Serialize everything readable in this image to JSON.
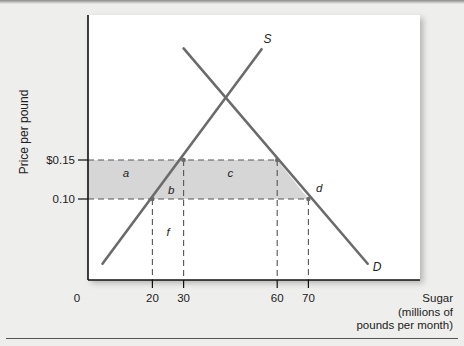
{
  "chart_data": {
    "type": "line",
    "title": "",
    "ylabel": "Price per pound",
    "xlabel": [
      "Sugar",
      "(millions of",
      "pounds per month)"
    ],
    "origin_label": "0",
    "x_ticks": [
      {
        "value": 20,
        "label": "20"
      },
      {
        "value": 30,
        "label": "30"
      },
      {
        "value": 60,
        "label": "60"
      },
      {
        "value": 70,
        "label": "70"
      }
    ],
    "y_ticks": [
      {
        "value": 0.15,
        "label": "$0.15"
      },
      {
        "value": 0.1,
        "label": "0.10"
      }
    ],
    "series": [
      {
        "name": "S",
        "kind": "supply",
        "points": [
          [
            4,
            0.017
          ],
          [
            55,
            0.292
          ]
        ]
      },
      {
        "name": "D",
        "kind": "demand",
        "points": [
          [
            30,
            0.293
          ],
          [
            89,
            0.017
          ]
        ]
      }
    ],
    "reference_lines": {
      "horizontal_prices": [
        0.15,
        0.1
      ],
      "vertical_quantities": [
        20,
        30,
        60,
        70
      ]
    },
    "shaded_band": {
      "price_low": 0.1,
      "price_high": 0.15,
      "quantity_from": 0,
      "quantity_to": 70
    },
    "area_labels": [
      {
        "label": "a",
        "x": 11.5,
        "y": 0.128
      },
      {
        "label": "b",
        "x": 26,
        "y": 0.107
      },
      {
        "label": "c",
        "x": 45,
        "y": 0.128
      },
      {
        "label": "d",
        "x": 73.5,
        "y": 0.109
      },
      {
        "label": "f",
        "x": 25,
        "y": 0.052
      }
    ],
    "colors": {
      "curve": "#6b6b6b",
      "shade": "#d6d6d6",
      "dash": "#555555",
      "axis": "#111111"
    }
  }
}
